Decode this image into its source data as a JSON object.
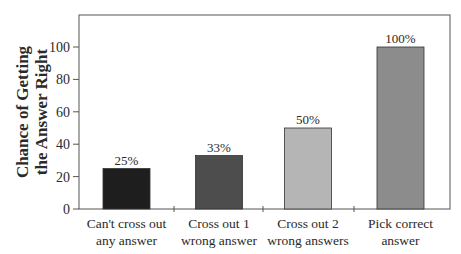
{
  "chart_data": {
    "type": "bar",
    "title": "",
    "xlabel": "",
    "ylabel": "Chance of Getting the Answer Right",
    "ylabel_lines": [
      "Chance of Getting",
      "the Answer Right"
    ],
    "ylim": [
      0,
      120
    ],
    "yticks": [
      0,
      20,
      40,
      60,
      80,
      100
    ],
    "grid": false,
    "legend": null,
    "categories": [
      "Can't cross out any answer",
      "Cross out 1 wrong answer",
      "Cross out 2 wrong answers",
      "Pick correct answer"
    ],
    "category_lines": [
      [
        "Can't cross out",
        "any answer"
      ],
      [
        "Cross out 1",
        "wrong answer"
      ],
      [
        "Cross out 2",
        "wrong answers"
      ],
      [
        "Pick correct",
        "answer"
      ]
    ],
    "values": [
      25,
      33,
      50,
      100
    ],
    "data_labels": [
      "25%",
      "33%",
      "50%",
      "100%"
    ],
    "bar_colors": [
      "#1e1e1e",
      "#4d4d4d",
      "#b5b5b5",
      "#8c8c8c"
    ]
  }
}
